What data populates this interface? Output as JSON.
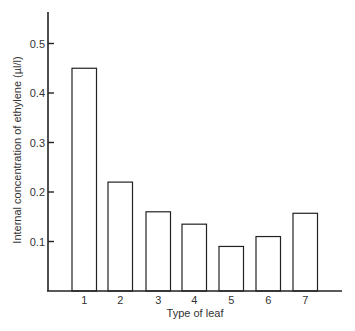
{
  "chart_data": {
    "type": "bar",
    "title": "",
    "xlabel": "Type of leaf",
    "ylabel": "Internal concentration of ethylene (µl/l)",
    "categories": [
      "1",
      "2",
      "3",
      "4",
      "5",
      "6",
      "7"
    ],
    "values": [
      0.45,
      0.22,
      0.16,
      0.135,
      0.09,
      0.11,
      0.157
    ],
    "ylim": [
      0,
      0.55
    ],
    "yticks": [
      "0.1",
      "0.2",
      "0.3",
      "0.4",
      "0.5"
    ],
    "grid": false,
    "legend": null,
    "bar_fill": "#ffffff",
    "bar_stroke": "#222222"
  }
}
